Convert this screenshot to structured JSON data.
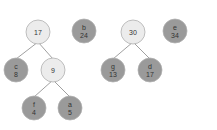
{
  "colors": {
    "internal_fill": "#ececec",
    "leaf_fill": "#9a9a9a",
    "stroke": "#b0b0b0",
    "edge": "#888888"
  },
  "nodes": [
    {
      "id": "n17",
      "type": "internal",
      "label": "",
      "value": "17",
      "x": 38,
      "y": 32
    },
    {
      "id": "b",
      "type": "leaf",
      "label": "b",
      "value": "24",
      "x": 84,
      "y": 31
    },
    {
      "id": "c",
      "type": "leaf",
      "label": "c",
      "value": "8",
      "x": 16,
      "y": 70
    },
    {
      "id": "n9",
      "type": "internal",
      "label": "",
      "value": "9",
      "x": 53,
      "y": 70
    },
    {
      "id": "f",
      "type": "leaf",
      "label": "f",
      "value": "4",
      "x": 34,
      "y": 108
    },
    {
      "id": "a",
      "type": "leaf",
      "label": "a",
      "value": "5",
      "x": 70,
      "y": 108
    },
    {
      "id": "n30",
      "type": "internal",
      "label": "",
      "value": "30",
      "x": 133,
      "y": 32
    },
    {
      "id": "e",
      "type": "leaf",
      "label": "e",
      "value": "34",
      "x": 175,
      "y": 31
    },
    {
      "id": "g",
      "type": "leaf",
      "label": "g",
      "value": "13",
      "x": 113,
      "y": 70
    },
    {
      "id": "d",
      "type": "leaf",
      "label": "d",
      "value": "17",
      "x": 150,
      "y": 70
    }
  ],
  "edges": [
    [
      "n17",
      "c"
    ],
    [
      "n17",
      "n9"
    ],
    [
      "n9",
      "f"
    ],
    [
      "n9",
      "a"
    ],
    [
      "n30",
      "g"
    ],
    [
      "n30",
      "d"
    ]
  ]
}
